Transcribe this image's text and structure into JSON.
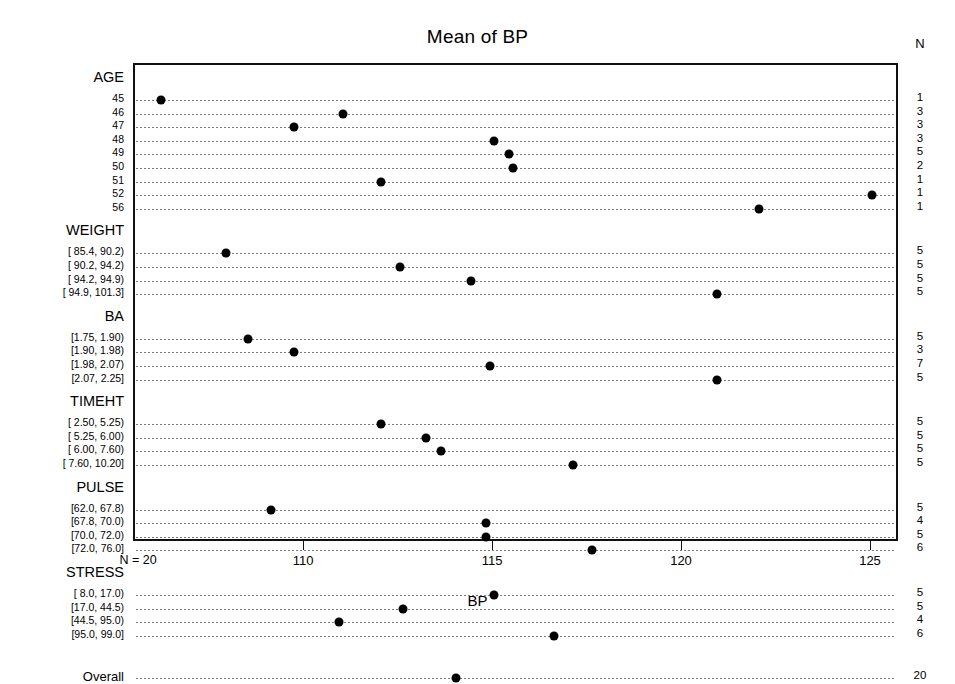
{
  "chart_data": {
    "type": "scatter",
    "title": "Mean of BP",
    "xlabel": "BP",
    "ylabel": "",
    "xlim": [
      105.6,
      125.9
    ],
    "xticks": [
      110,
      115,
      120,
      125
    ],
    "xticklabels": [
      "110",
      "115",
      "120",
      "125"
    ],
    "grid": "dotted-horizontal-per-row",
    "n_column_header": "N",
    "n_axis_note": "N = 20",
    "groups": [
      {
        "name": "AGE",
        "levels": [
          {
            "label": "45",
            "value": 106.2,
            "n": 1
          },
          {
            "label": "46",
            "value": 111.0,
            "n": 3
          },
          {
            "label": "47",
            "value": 109.7,
            "n": 3
          },
          {
            "label": "48",
            "value": 115.0,
            "n": 3
          },
          {
            "label": "49",
            "value": 115.4,
            "n": 5
          },
          {
            "label": "50",
            "value": 115.5,
            "n": 2
          },
          {
            "label": "51",
            "value": 112.0,
            "n": 1
          },
          {
            "label": "52",
            "value": 125.0,
            "n": 1
          },
          {
            "label": "56",
            "value": 122.0,
            "n": 1
          }
        ]
      },
      {
        "name": "WEIGHT",
        "levels": [
          {
            "label": "[ 85.4, 90.2)",
            "value": 107.9,
            "n": 5
          },
          {
            "label": "[ 90.2, 94.2)",
            "value": 112.5,
            "n": 5
          },
          {
            "label": "[ 94.2, 94.9)",
            "value": 114.4,
            "n": 5
          },
          {
            "label": "[ 94.9, 101.3]",
            "value": 120.9,
            "n": 5
          }
        ]
      },
      {
        "name": "BA",
        "levels": [
          {
            "label": "[1.75, 1.90)",
            "value": 108.5,
            "n": 5
          },
          {
            "label": "[1.90, 1.98)",
            "value": 109.7,
            "n": 3
          },
          {
            "label": "[1.98, 2.07)",
            "value": 114.9,
            "n": 7
          },
          {
            "label": "[2.07, 2.25]",
            "value": 120.9,
            "n": 5
          }
        ]
      },
      {
        "name": "TIMEHT",
        "levels": [
          {
            "label": "[ 2.50, 5.25)",
            "value": 112.0,
            "n": 5
          },
          {
            "label": "[ 5.25, 6.00)",
            "value": 113.2,
            "n": 5
          },
          {
            "label": "[ 6.00, 7.60)",
            "value": 113.6,
            "n": 5
          },
          {
            "label": "[ 7.60, 10.20]",
            "value": 117.1,
            "n": 5
          }
        ]
      },
      {
        "name": "PULSE",
        "levels": [
          {
            "label": "[62.0, 67.8)",
            "value": 109.1,
            "n": 5
          },
          {
            "label": "[67.8, 70.0)",
            "value": 114.8,
            "n": 4
          },
          {
            "label": "[70.0, 72.0)",
            "value": 114.8,
            "n": 5
          },
          {
            "label": "[72.0, 76.0]",
            "value": 117.6,
            "n": 6
          }
        ]
      },
      {
        "name": "STRESS",
        "levels": [
          {
            "label": "[ 8.0, 17.0)",
            "value": 115.0,
            "n": 5
          },
          {
            "label": "[17.0, 44.5)",
            "value": 112.6,
            "n": 5
          },
          {
            "label": "[44.5, 95.0)",
            "value": 110.9,
            "n": 4
          },
          {
            "label": "[95.0, 99.0]",
            "value": 116.6,
            "n": 6
          }
        ]
      },
      {
        "name": "",
        "levels": [
          {
            "label": "Overall",
            "value": 114.0,
            "n": 20
          }
        ]
      }
    ]
  },
  "style": {
    "point_color": "#000000",
    "frame_color": "#111111",
    "grid_color": "#7a7a7a"
  }
}
